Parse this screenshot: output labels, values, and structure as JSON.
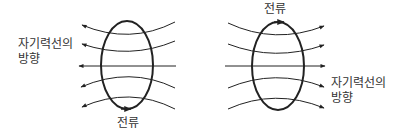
{
  "left_diagram": {
    "field_label_line1": "자기력선의",
    "field_label_line2": "방향",
    "current_label": "전류",
    "field_direction": "left",
    "current_arrow_at": "bottom"
  },
  "right_diagram": {
    "field_label_line1": "자기력선의",
    "field_label_line2": "방향",
    "current_label": "전류",
    "field_direction": "right",
    "current_arrow_at": "top"
  },
  "colors": {
    "line": "#222222",
    "text": "#333333"
  }
}
